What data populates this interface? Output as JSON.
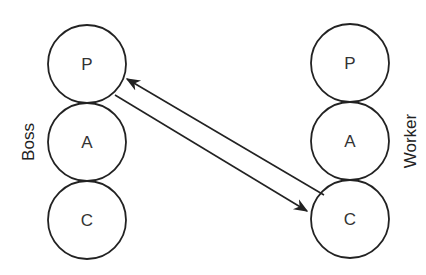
{
  "diagram": {
    "type": "transactional-analysis-crossed-transaction",
    "left": {
      "label": "Boss",
      "states": [
        {
          "id": "P",
          "label": "P"
        },
        {
          "id": "A",
          "label": "A"
        },
        {
          "id": "C",
          "label": "C"
        }
      ]
    },
    "right": {
      "label": "Worker",
      "states": [
        {
          "id": "P",
          "label": "P"
        },
        {
          "id": "A",
          "label": "A"
        },
        {
          "id": "C",
          "label": "C"
        }
      ]
    },
    "edges": [
      {
        "from": "Boss.P",
        "to": "Worker.C",
        "direction": "forward"
      },
      {
        "from": "Worker.C",
        "to": "Boss.P",
        "direction": "forward"
      }
    ],
    "colors": {
      "stroke": "#222222",
      "text": "#333333",
      "background": "#ffffff"
    }
  }
}
